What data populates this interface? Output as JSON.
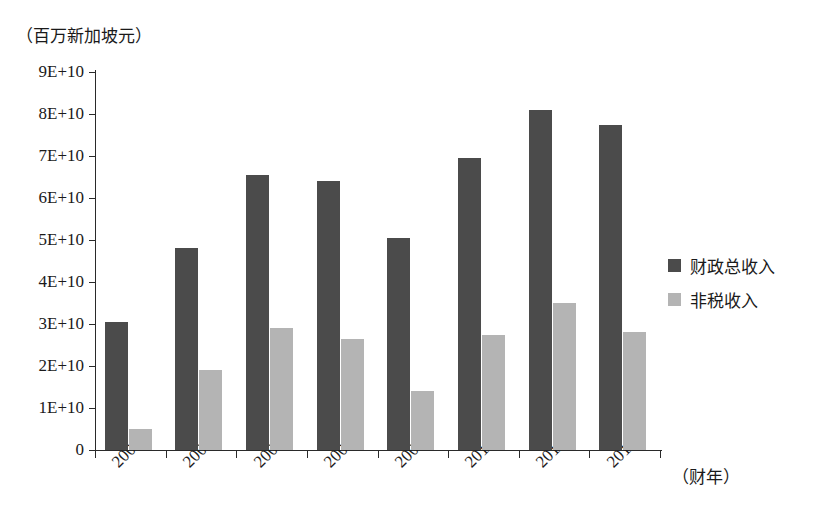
{
  "chart_data": {
    "type": "bar",
    "title": "",
    "subtitle": "",
    "xlabel": "（财年）",
    "ylabel": "（百万新加坡元）",
    "categories": [
      "2005",
      "2006",
      "2007",
      "2008",
      "2009",
      "2010",
      "2011",
      "2012"
    ],
    "series": [
      {
        "name": "财政总收入",
        "color": "#4b4b4b",
        "values": [
          30500000000,
          48000000000,
          65500000000,
          64000000000,
          50500000000,
          69500000000,
          81000000000,
          77500000000
        ]
      },
      {
        "name": "非税收入",
        "color": "#b4b4b4",
        "values": [
          5000000000,
          19000000000,
          29000000000,
          26500000000,
          14000000000,
          27500000000,
          35000000000,
          28000000000
        ]
      }
    ],
    "ylim": [
      0,
      90000000000
    ],
    "ytick_labels": [
      "0",
      "1E+10",
      "2E+10",
      "3E+10",
      "4E+10",
      "5E+10",
      "6E+10",
      "7E+10",
      "8E+10",
      "9E+10"
    ],
    "ytick_values": [
      0,
      10000000000,
      20000000000,
      30000000000,
      40000000000,
      50000000000,
      60000000000,
      70000000000,
      80000000000,
      90000000000
    ],
    "grid": false,
    "legend_position": "right"
  }
}
